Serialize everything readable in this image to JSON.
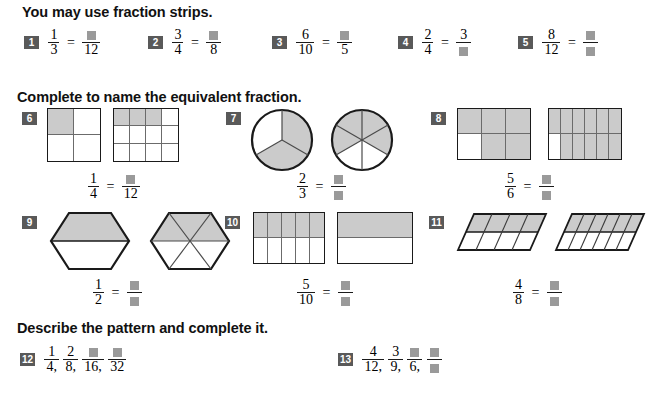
{
  "sections": [
    {
      "id": "s1",
      "heading": "You may use fraction strips."
    },
    {
      "id": "s2",
      "heading": "Complete to name the equivalent fraction."
    },
    {
      "id": "s3",
      "heading": "Describe the pattern and complete it."
    }
  ],
  "equals_sign": "=",
  "comma": ",",
  "row1": [
    {
      "number": "1",
      "left_num": "1",
      "left_den": "3",
      "right_num": "",
      "right_den": "12"
    },
    {
      "number": "2",
      "left_num": "3",
      "left_den": "4",
      "right_num": "",
      "right_den": "8"
    },
    {
      "number": "3",
      "left_num": "6",
      "left_den": "10",
      "right_num": "",
      "right_den": "5"
    },
    {
      "number": "4",
      "left_num": "2",
      "left_den": "4",
      "right_num": "3",
      "right_den": ""
    },
    {
      "number": "5",
      "left_num": "8",
      "left_den": "12",
      "right_num": "",
      "right_den": ""
    }
  ],
  "figures": [
    {
      "number": "6",
      "shape": "square-grid",
      "left_num": "1",
      "left_den": "4",
      "right_num": "",
      "right_den": "12",
      "left_fig": {
        "cols": 2,
        "rows": 2,
        "shaded": 1
      },
      "right_fig": {
        "cols": 4,
        "rows": 3,
        "shaded": 3
      }
    },
    {
      "number": "7",
      "shape": "circle",
      "left_num": "2",
      "left_den": "3",
      "right_num": "",
      "right_den": "",
      "left_fig": {
        "slices": 3,
        "shaded": 2
      },
      "right_fig": {
        "slices": 6,
        "shaded": 4
      }
    },
    {
      "number": "8",
      "shape": "rect-grid",
      "left_num": "5",
      "left_den": "6",
      "right_num": "",
      "right_den": "",
      "left_fig": {
        "cols": 3,
        "rows": 2,
        "shaded": 5
      },
      "right_fig": {
        "cols": 6,
        "rows": 2,
        "shaded": 10
      }
    },
    {
      "number": "9",
      "shape": "hexagon",
      "left_num": "1",
      "left_den": "2",
      "right_num": "",
      "right_den": "",
      "left_fig": {
        "parts": 2,
        "shaded": 1
      },
      "right_fig": {
        "parts": 6,
        "shaded": 3
      }
    },
    {
      "number": "10",
      "shape": "rect-grid",
      "left_num": "5",
      "left_den": "10",
      "right_num": "",
      "right_den": "",
      "left_fig": {
        "cols": 5,
        "rows": 2,
        "shaded": 5
      },
      "right_fig": {
        "cols": 1,
        "rows": 2,
        "shaded": 1
      }
    },
    {
      "number": "11",
      "shape": "parallelogram",
      "left_num": "4",
      "left_den": "8",
      "right_num": "",
      "right_den": "",
      "left_fig": {
        "cols": 4,
        "rows": 2,
        "shaded": 4
      },
      "right_fig": {
        "cols": 6,
        "rows": 2,
        "shaded": 6
      }
    }
  ],
  "patterns": [
    {
      "number": "12",
      "terms": [
        {
          "num": "1",
          "den": "4"
        },
        {
          "num": "2",
          "den": "8"
        },
        {
          "num": "",
          "den": "16"
        },
        {
          "num": "",
          "den": "32"
        }
      ]
    },
    {
      "number": "13",
      "terms": [
        {
          "num": "4",
          "den": "12"
        },
        {
          "num": "3",
          "den": "9"
        },
        {
          "num": "",
          "den": "6"
        },
        {
          "num": "",
          "den": ""
        }
      ]
    }
  ],
  "colors": {
    "badge_bg": "#595959",
    "badge_fg": "#ffffff",
    "answer_box": "#9a9a9a",
    "shade_fill": "#cbcbcb",
    "outline": "#1a1a1a",
    "inner_line": "#6b6b6b",
    "page_bg": "#ffffff"
  }
}
